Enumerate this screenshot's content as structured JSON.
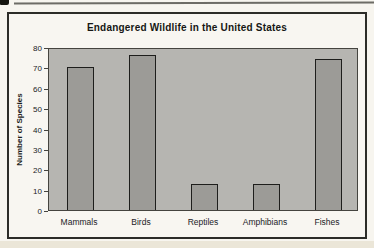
{
  "chart_data": {
    "type": "bar",
    "title": "Endangered Wildlife in the United States",
    "ylabel": "Number of Species",
    "xlabel": "",
    "categories": [
      "Mammals",
      "Birds",
      "Reptiles",
      "Amphibians",
      "Fishes"
    ],
    "values": [
      70,
      76,
      13,
      13,
      74
    ],
    "ylim": [
      0,
      80
    ],
    "ytick_step": 10,
    "grid": false,
    "legend": "none",
    "colors": {
      "plot_background": "#b6b5b1",
      "bar_fill": "#9c9b97",
      "bar_border": "#1e1e1c",
      "frame_border": "#2c2c28",
      "text": "#1c1c1a"
    }
  }
}
